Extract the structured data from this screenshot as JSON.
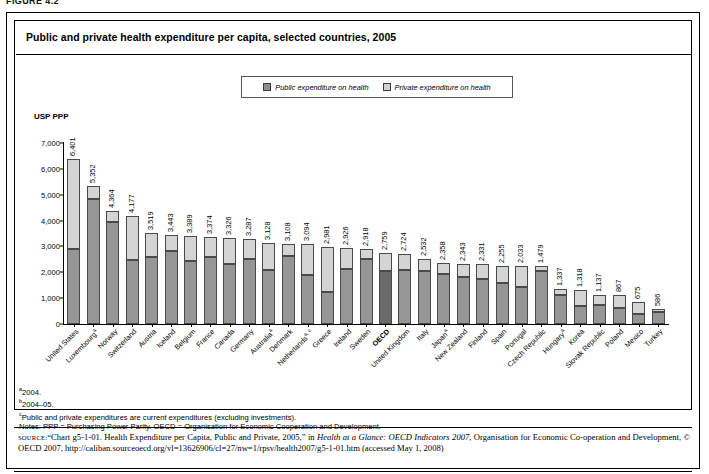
{
  "figure_label": "FIGURE 4.2",
  "title": "Public and private health expenditure per capita, selected countries, 2005",
  "legend": {
    "public_label": "Public expenditure on health",
    "private_label": "Private expenditure on health"
  },
  "axis": {
    "ylabel": "USP PPP"
  },
  "notes": {
    "a": "2004.",
    "b": "2004–05.",
    "c": "Public and private expenditures are current expenditures (excluding investments).",
    "general": "Notes: PPP = Purchasing Power Parity.  OECD = Organisation for Economic Cooperation and Development."
  },
  "source": {
    "lead": "SOURCE:",
    "text_1": "“Chart g5-1-01. Health Expenditure per Capita, Public and Private, 2005,” in ",
    "italic_1": "Health at a Glance: OECD Indicators 2007",
    "text_2": ", Organisation for Economic Co-operation and Development, © OECD 2007, http://caliban.sourceoecd.org/vl=13626906/cl=27/nw=1/rpsv/health2007/g5-1-01.htm (accessed May 1, 2008)"
  },
  "chart_data": {
    "type": "bar",
    "subtype": "stacked",
    "title": "Public and private health expenditure per capita, selected countries, 2005",
    "xlabel": "",
    "ylabel": "USP PPP",
    "ylim": [
      0,
      7000
    ],
    "yticks": [
      0,
      1000,
      2000,
      3000,
      4000,
      5000,
      6000,
      7000
    ],
    "ytick_labels": [
      "0",
      "1,000",
      "2,000",
      "3,000",
      "4,000",
      "5,000",
      "6,000",
      "7,000"
    ],
    "grid": false,
    "legend_position": "top-center",
    "colors": {
      "public": "#969696",
      "private": "#d4d4d4",
      "public_highlight": "#6a6a6a"
    },
    "categories": [
      "United States",
      "Luxembourg",
      "Norway",
      "Switzerland",
      "Austria",
      "Iceland",
      "Belgium",
      "France",
      "Canada",
      "Germany",
      "Australia",
      "Denmark",
      "Netherlands",
      "Greece",
      "Ireland",
      "Sweden",
      "OECD",
      "United Kingdom",
      "Italy",
      "Japan",
      "New Zealand",
      "Finland",
      "Spain",
      "Portugal",
      "Czech Republic",
      "Hungary",
      "Korea",
      "Slovak Republic",
      "Poland",
      "Mexico",
      "Turkey"
    ],
    "category_footnotes": [
      "",
      "a",
      "",
      "",
      "",
      "",
      "",
      "",
      "",
      "",
      "a",
      "",
      "a, c",
      "",
      "",
      "",
      "",
      "",
      "",
      "a",
      "",
      "",
      "",
      "",
      "",
      "a",
      "",
      "",
      "",
      "",
      ""
    ],
    "category_highlight": [
      false,
      false,
      false,
      false,
      false,
      false,
      false,
      false,
      false,
      false,
      false,
      false,
      false,
      false,
      false,
      false,
      true,
      false,
      false,
      false,
      false,
      false,
      false,
      false,
      false,
      false,
      false,
      false,
      false,
      false,
      false
    ],
    "series": [
      {
        "name": "Public expenditure on health",
        "values": [
          2884,
          4818,
          3927,
          2468,
          2610,
          2812,
          2427,
          2586,
          2336,
          2519,
          2072,
          2626,
          1893,
          1252,
          2141,
          2496,
          2062,
          2102,
          2055,
          1921,
          1823,
          1743,
          1604,
          1447,
          2037,
          1132,
          686,
          733,
          606,
          385,
          480
        ]
      },
      {
        "name": "Private expenditure on health",
        "values": [
          3517,
          534,
          437,
          1709,
          909,
          631,
          962,
          788,
          990,
          768,
          1056,
          482,
          1201,
          1729,
          785,
          422,
          697,
          622,
          477,
          422,
          508,
          588,
          651,
          808,
          218,
          205,
          632,
          404,
          531,
          482,
          106
        ]
      }
    ],
    "totals": [
      6401,
      5352,
      4364,
      4177,
      3519,
      3443,
      3389,
      3374,
      3326,
      3287,
      3128,
      3108,
      3094,
      2981,
      2926,
      2918,
      2759,
      2724,
      2532,
      2343,
      2331,
      2331,
      2255,
      2255,
      2255,
      1337,
      1318,
      1137,
      1137,
      867,
      586
    ],
    "total_labels": [
      "6,401",
      "5,352",
      "4,364",
      "4,177",
      "3,519",
      "3,443",
      "3,389",
      "3,374",
      "3,326",
      "3,287",
      "3,128",
      "3,108",
      "3,094",
      "2,981",
      "2,926",
      "2,918",
      "2,759",
      "2,724",
      "2,532",
      "2,358",
      "2,343",
      "2,331",
      "2,255",
      "2,033",
      "1,479",
      "1,337",
      "1,318",
      "1,137",
      "867",
      "675",
      "586"
    ]
  }
}
